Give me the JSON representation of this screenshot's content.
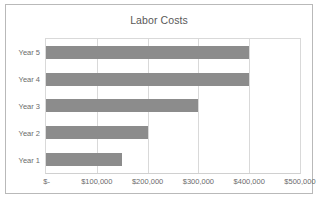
{
  "chart_data": {
    "type": "bar",
    "orientation": "horizontal",
    "title": "Labor Costs",
    "xlabel": "",
    "ylabel": "",
    "categories": [
      "Year 5",
      "Year 4",
      "Year 3",
      "Year 2",
      "Year 1"
    ],
    "values": [
      400000,
      400000,
      300000,
      200000,
      150000
    ],
    "xlim": [
      0,
      500000
    ],
    "xticks": [
      0,
      100000,
      200000,
      300000,
      400000,
      500000
    ],
    "xtick_labels": [
      "$-",
      "$100,000",
      "$200,000",
      "$300,000",
      "$400,000",
      "$500,000"
    ],
    "grid": "vertical",
    "legend": "none",
    "series": [
      {
        "name": "Labor Costs",
        "values": [
          400000,
          400000,
          300000,
          200000,
          150000
        ],
        "color": "#8c8c8c"
      }
    ],
    "axis_inverted": true
  },
  "colors": {
    "bar": "#8c8c8c",
    "gridline": "#d9d9d9",
    "frame": "#b9b9b9",
    "title_text": "#595959",
    "axis_text": "#6b6b6b",
    "background": "#ffffff"
  }
}
